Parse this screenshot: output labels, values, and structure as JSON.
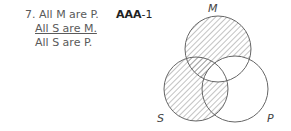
{
  "problem": {
    "number": "7.",
    "premise_major": "All M are P.",
    "premise_minor": "All S are M.",
    "conclusion": "All S are P.",
    "form_bold": "AAA",
    "form_figure": "-1"
  },
  "diagram": {
    "labels": {
      "M": "M",
      "S": "S",
      "P": "P"
    },
    "shaded_regions": [
      "M only",
      "M∩S not P",
      "S only",
      "S∩P not M"
    ],
    "unshaded_regions": [
      "M∩S∩P",
      "M∩P not S",
      "P only"
    ]
  }
}
